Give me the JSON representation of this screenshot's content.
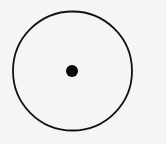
{
  "diagram": {
    "type": "circle-with-center-point",
    "background_color": "#f5f5f4",
    "stroke_color": "#111111",
    "circle": {
      "cx": 72.5,
      "cy": 71,
      "r": 59.5,
      "stroke_width": 1.8
    },
    "center_point": {
      "cx": 72,
      "cy": 71,
      "r": 6,
      "fill": "#0a0a0a"
    }
  }
}
